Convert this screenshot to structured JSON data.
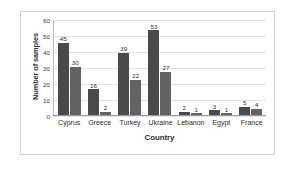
{
  "chart_data": {
    "type": "bar",
    "title": "",
    "xlabel": "Country",
    "ylabel": "Number of samples",
    "categories": [
      "Cyprus",
      "Greece",
      "Turkey",
      "Ukraine",
      "Lebanon",
      "Egypt",
      "France"
    ],
    "series": [
      {
        "name": "Series 1",
        "values": [
          45,
          16,
          39,
          53,
          2,
          3,
          5
        ],
        "color": "#4a4a4a"
      },
      {
        "name": "Series 2",
        "values": [
          30,
          2,
          22,
          27,
          1,
          1,
          4
        ],
        "color": "#636363"
      }
    ],
    "ylim": [
      0,
      60
    ],
    "yticks": [
      0,
      10,
      20,
      30,
      40,
      50,
      60
    ],
    "grid": true,
    "legend": "none",
    "data_labels": true
  }
}
